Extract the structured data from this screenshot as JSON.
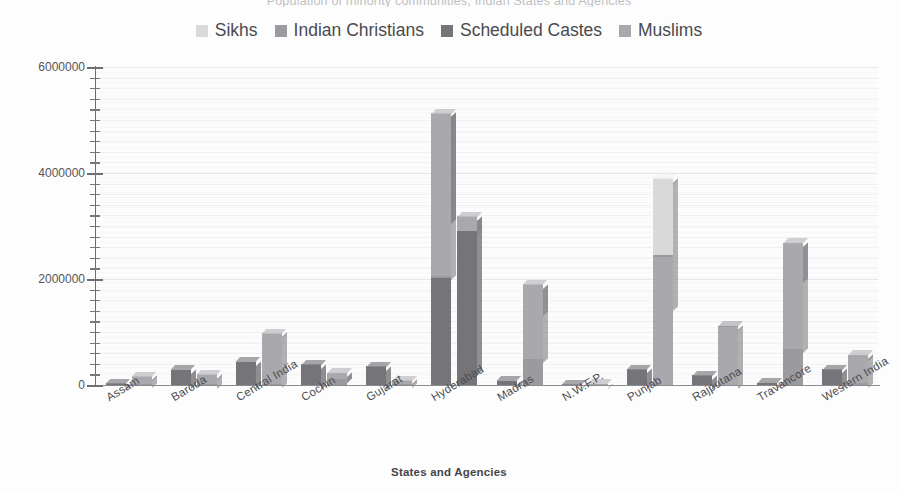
{
  "chart": {
    "title": "Population of minority communities, Indian States and Agencies",
    "x_axis_title": "States and Agencies",
    "legend_position": "top-center"
  },
  "legend": {
    "items": [
      {
        "label": "Sikhs",
        "color": "#d9d9d9",
        "icon": "legend-swatch-icon"
      },
      {
        "label": "Indian Christians",
        "color": "#9a9a9f",
        "icon": "legend-swatch-icon"
      },
      {
        "label": "Scheduled Castes",
        "color": "#747479",
        "icon": "legend-swatch-icon"
      },
      {
        "label": "Muslims",
        "color": "#a8a8ad",
        "icon": "legend-swatch-icon"
      }
    ]
  },
  "y_axis": {
    "ticks": [
      "0",
      "2000000",
      "4000000",
      "6000000"
    ],
    "min": 0,
    "max": 6000000,
    "minor_tick_step": 200000
  },
  "chart_data": {
    "type": "bar",
    "title": "Population of minority communities, Indian States and Agencies",
    "xlabel": "States and Agencies",
    "ylabel": "",
    "ylim": [
      0,
      6000000
    ],
    "grid": true,
    "stacked": true,
    "grouped": true,
    "legend_position": "top-center",
    "categories": [
      "Assam",
      "Baroda",
      "Central India",
      "Cochin",
      "Gujarat",
      "Hyderabad",
      "Madras",
      "N.W.F.P.",
      "Punjab",
      "Rajputana",
      "Travancore",
      "Western India"
    ],
    "series": [
      {
        "name": "Sikhs",
        "color": "#d9d9d9",
        "values": [
          0,
          0,
          0,
          0,
          0,
          0,
          0,
          0,
          1450000,
          0,
          0,
          0
        ]
      },
      {
        "name": "Indian Christians",
        "color": "#9a9a9f",
        "values": [
          20000,
          10000,
          20000,
          120000,
          10000,
          40000,
          500000,
          5000,
          30000,
          10000,
          680000,
          30000
        ]
      },
      {
        "name": "Scheduled Castes",
        "color": "#747479",
        "values": [
          30000,
          290000,
          440000,
          390000,
          350000,
          2010000,
          80000,
          15000,
          2420000,
          180000,
          40000,
          300000
        ]
      },
      {
        "name": "Muslims",
        "color": "#a8a8ad",
        "values": [
          150000,
          190000,
          960000,
          110000,
          80000,
          3080000,
          1400000,
          25000,
          0,
          1110000,
          2000000,
          540000
        ]
      }
    ],
    "bars": [
      {
        "category": "Assam",
        "column": 1,
        "segments": [
          {
            "series": "Scheduled Castes",
            "value": 30000
          }
        ]
      },
      {
        "category": "Assam",
        "column": 2,
        "segments": [
          {
            "series": "Indian Christians",
            "value": 20000
          },
          {
            "series": "Muslims",
            "value": 150000
          }
        ]
      },
      {
        "category": "Baroda",
        "column": 1,
        "segments": [
          {
            "series": "Scheduled Castes",
            "value": 290000
          }
        ]
      },
      {
        "category": "Baroda",
        "column": 2,
        "segments": [
          {
            "series": "Indian Christians",
            "value": 10000
          },
          {
            "series": "Muslims",
            "value": 190000
          }
        ]
      },
      {
        "category": "Central India",
        "column": 1,
        "segments": [
          {
            "series": "Scheduled Castes",
            "value": 440000
          }
        ]
      },
      {
        "category": "Central India",
        "column": 2,
        "segments": [
          {
            "series": "Indian Christians",
            "value": 20000
          },
          {
            "series": "Muslims",
            "value": 960000
          }
        ]
      },
      {
        "category": "Cochin",
        "column": 1,
        "segments": [
          {
            "series": "Scheduled Castes",
            "value": 390000
          }
        ]
      },
      {
        "category": "Cochin",
        "column": 2,
        "segments": [
          {
            "series": "Indian Christians",
            "value": 120000
          },
          {
            "series": "Muslims",
            "value": 110000
          }
        ]
      },
      {
        "category": "Gujarat",
        "column": 1,
        "segments": [
          {
            "series": "Scheduled Castes",
            "value": 350000
          }
        ]
      },
      {
        "category": "Gujarat",
        "column": 2,
        "segments": [
          {
            "series": "Indian Christians",
            "value": 10000
          },
          {
            "series": "Muslims",
            "value": 80000
          }
        ]
      },
      {
        "category": "Hyderabad",
        "column": 1,
        "segments": [
          {
            "series": "Scheduled Castes",
            "value": 2010000
          },
          {
            "series": "Indian Christians",
            "value": 40000
          },
          {
            "series": "Muslims",
            "value": 3080000
          }
        ]
      },
      {
        "category": "Hyderabad",
        "column": 2,
        "segments": [
          {
            "series": "Scheduled Castes",
            "value": 2900000
          },
          {
            "series": "Muslims",
            "value": 280000
          }
        ]
      },
      {
        "category": "Madras",
        "column": 1,
        "segments": [
          {
            "series": "Scheduled Castes",
            "value": 80000
          }
        ]
      },
      {
        "category": "Madras",
        "column": 2,
        "segments": [
          {
            "series": "Indian Christians",
            "value": 500000
          },
          {
            "series": "Muslims",
            "value": 1400000
          }
        ]
      },
      {
        "category": "N.W.F.P.",
        "column": 1,
        "segments": [
          {
            "series": "Scheduled Castes",
            "value": 15000
          }
        ]
      },
      {
        "category": "N.W.F.P.",
        "column": 2,
        "segments": [
          {
            "series": "Muslims",
            "value": 25000
          }
        ]
      },
      {
        "category": "Punjab",
        "column": 1,
        "segments": [
          {
            "series": "Scheduled Castes",
            "value": 300000
          }
        ]
      },
      {
        "category": "Punjab",
        "column": 2,
        "segments": [
          {
            "series": "Muslims",
            "value": 2420000
          },
          {
            "series": "Indian Christians",
            "value": 30000
          },
          {
            "series": "Sikhs",
            "value": 1450000
          }
        ]
      },
      {
        "category": "Rajputana",
        "column": 1,
        "segments": [
          {
            "series": "Scheduled Castes",
            "value": 180000
          }
        ]
      },
      {
        "category": "Rajputana",
        "column": 2,
        "segments": [
          {
            "series": "Muslims",
            "value": 1110000
          },
          {
            "series": "Indian Christians",
            "value": 10000
          }
        ]
      },
      {
        "category": "Travancore",
        "column": 1,
        "segments": [
          {
            "series": "Scheduled Castes",
            "value": 40000
          }
        ]
      },
      {
        "category": "Travancore",
        "column": 2,
        "segments": [
          {
            "series": "Indian Christians",
            "value": 680000
          },
          {
            "series": "Muslims",
            "value": 2000000
          }
        ]
      },
      {
        "category": "Western India",
        "column": 1,
        "segments": [
          {
            "series": "Scheduled Castes",
            "value": 300000
          }
        ]
      },
      {
        "category": "Western India",
        "column": 2,
        "segments": [
          {
            "series": "Indian Christians",
            "value": 30000
          },
          {
            "series": "Muslims",
            "value": 540000
          }
        ]
      }
    ]
  }
}
